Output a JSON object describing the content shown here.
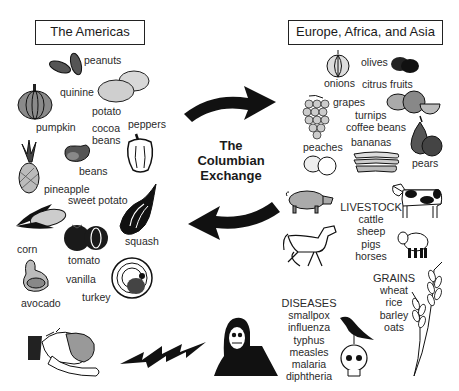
{
  "title": {
    "line1": "The",
    "line2": "Columbian",
    "line3": "Exchange"
  },
  "americas": {
    "heading": "The Americas",
    "items": [
      "peanuts",
      "quinine",
      "potato",
      "pumpkin",
      "cocoa",
      "beans",
      "peppers",
      "beans",
      "pineapple",
      "sweet potato",
      "corn",
      "tomato",
      "squash",
      "vanilla",
      "avocado",
      "turkey"
    ],
    "labels": {
      "peanuts": "peanuts",
      "quinine": "quinine",
      "potato": "potato",
      "pumpkin": "pumpkin",
      "cocoa_1": "cocoa",
      "cocoa_2": "beans",
      "peppers": "peppers",
      "beans": "beans",
      "pineapple": "pineapple",
      "sweet_potato": "sweet potato",
      "corn": "corn",
      "tomato": "tomato",
      "squash": "squash",
      "vanilla": "vanilla",
      "avocado": "avocado",
      "turkey": "turkey"
    }
  },
  "old_world": {
    "heading": "Europe, Africa, and Asia",
    "labels": {
      "onions": "onions",
      "olives": "olives",
      "citrus_fruits": "citrus fruits",
      "grapes": "grapes",
      "turnips": "turnips",
      "coffee_beans": "coffee beans",
      "bananas": "bananas",
      "peaches": "peaches",
      "pears": "pears"
    },
    "livestock": {
      "heading": "LIVESTOCK",
      "items": [
        "cattle",
        "sheep",
        "pigs",
        "horses"
      ]
    },
    "grains": {
      "heading": "GRAINS",
      "items": [
        "wheat",
        "rice",
        "barley",
        "oats"
      ]
    },
    "diseases": {
      "heading": "DISEASES",
      "items": [
        "smallpox",
        "influenza",
        "typhus",
        "measles",
        "malaria",
        "diphtheria"
      ]
    }
  },
  "arrows": {
    "to_old_world": "right",
    "to_americas": "left",
    "disease_transfer": "left-lightning"
  },
  "colors": {
    "ink": "#1a1a1a",
    "fill_gray": "#9a9a9a",
    "light_gray": "#c8c8c8",
    "background": "#ffffff"
  }
}
